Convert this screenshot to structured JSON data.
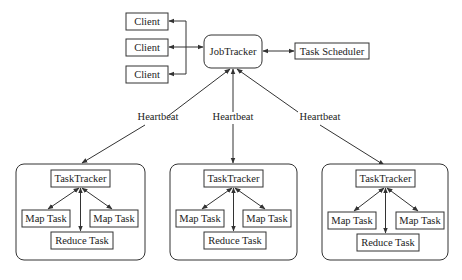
{
  "diagram": {
    "clients": [
      {
        "label": "Client"
      },
      {
        "label": "Client"
      },
      {
        "label": "Client"
      }
    ],
    "job_tracker": {
      "label": "JobTracker"
    },
    "task_scheduler": {
      "label": "Task Scheduler"
    },
    "heartbeats": [
      {
        "label": "Heartbeat"
      },
      {
        "label": "Heartbeat"
      },
      {
        "label": "Heartbeat"
      }
    ],
    "nodes": [
      {
        "task_tracker": "TaskTracker",
        "map_left": "Map Task",
        "map_right": "Map Task",
        "reduce": "Reduce Task"
      },
      {
        "task_tracker": "TaskTracker",
        "map_left": "Map Task",
        "map_right": "Map Task",
        "reduce": "Reduce Task"
      },
      {
        "task_tracker": "TaskTracker",
        "map_left": "Map Task",
        "map_right": "Map Task",
        "reduce": "Reduce Task"
      }
    ],
    "colors": {
      "stroke": "#333333",
      "text": "#222222",
      "background": "#ffffff"
    }
  }
}
